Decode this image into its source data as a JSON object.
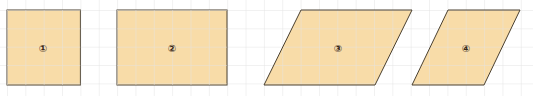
{
  "diagram": {
    "grid_size": 18.35,
    "grid_color": "#e4e4e4",
    "fill_color": "#f8dca8",
    "stroke_color": "#4a4030",
    "shapes": [
      {
        "id": "1",
        "label": "①",
        "type": "square",
        "cx": 43,
        "cy": 48
      },
      {
        "id": "2",
        "label": "②",
        "type": "rectangle",
        "cx": 172,
        "cy": 48
      },
      {
        "id": "3",
        "label": "③",
        "type": "parallelogram",
        "cx": 338,
        "cy": 48
      },
      {
        "id": "4",
        "label": "④",
        "type": "parallelogram",
        "cx": 466,
        "cy": 48
      }
    ]
  }
}
